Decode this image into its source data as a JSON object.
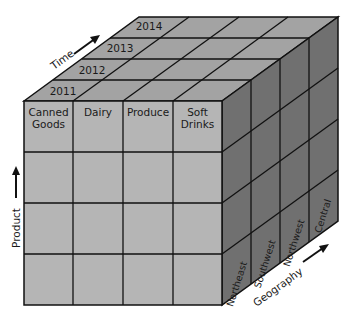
{
  "diagram": {
    "colors": {
      "front_face": "#b5b5b5",
      "top_face": "#a3a3a3",
      "side_face": "#707070",
      "grid_line": "#111111",
      "text": "#1a1a1a"
    },
    "axes": {
      "time": {
        "label": "Time",
        "values": [
          "2011",
          "2012",
          "2013",
          "2014"
        ]
      },
      "product": {
        "label": "Product",
        "values": [
          "Canned Goods",
          "Dairy",
          "Produce",
          "Soft Drinks"
        ]
      },
      "geography": {
        "label": "Geography",
        "values": [
          "Northeast",
          "Southwest",
          "Northwest",
          "Central"
        ]
      }
    },
    "product_labels": [
      {
        "line1": "Canned",
        "line2": "Goods"
      },
      {
        "line1": "Dairy",
        "line2": ""
      },
      {
        "line1": "Produce",
        "line2": ""
      },
      {
        "line1": "Soft",
        "line2": "Drinks"
      }
    ],
    "front_rows": 4,
    "front_cols": 4
  }
}
